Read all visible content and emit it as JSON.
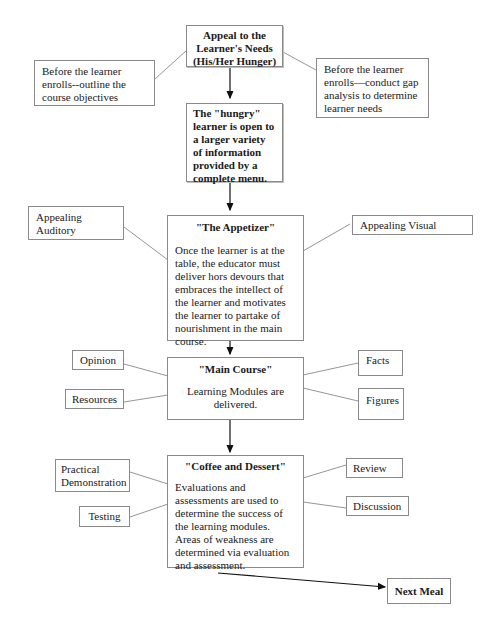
{
  "diagram": {
    "main_flow": [
      {
        "id": "appeal",
        "title": "Appeal to the Learner's Needs (His/Her Hunger)"
      },
      {
        "id": "hungry",
        "title": "The \"hungry\" learner is open to a larger variety of information provided by a complete menu."
      },
      {
        "id": "appetizer",
        "title": "\"The Appetizer\"",
        "body": "Once the learner is at the table, the educator must deliver hors devours that embraces the intellect of the learner and motivates the learner to partake of nourishment in the main course."
      },
      {
        "id": "main_course",
        "title": "\"Main Course\"",
        "body": "Learning Modules are delivered."
      },
      {
        "id": "coffee",
        "title": "\"Coffee and Dessert\"",
        "body": "Evaluations and assessments  are used to determine the success of the learning modules.  Areas of weakness are determined via evaluation and assessment."
      },
      {
        "id": "next_meal",
        "title": "Next Meal"
      }
    ],
    "side_notes": {
      "appeal_left": "Before the learner enrolls--outline the course objectives",
      "appeal_right": "Before the learner enrolls—conduct gap analysis to determine learner needs",
      "appetizer_left": "Appealing Auditory",
      "appetizer_right": "Appealing Visual",
      "main_left_1": "Opinion",
      "main_left_2": "Resources",
      "main_right_1": "Facts",
      "main_right_2": "Figures",
      "coffee_left_1": "Practical Demonstration",
      "coffee_left_2": "Testing",
      "coffee_right_1": "Review",
      "coffee_right_2": "Discussion"
    },
    "colors": {
      "border": "#8a8a8a",
      "line": "#7a7a7a",
      "arrow": "#111111"
    }
  }
}
